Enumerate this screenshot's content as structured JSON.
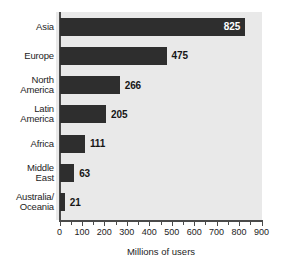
{
  "chart_data": {
    "type": "bar",
    "orientation": "horizontal",
    "title": "",
    "xlabel": "Millions of users",
    "ylabel": "",
    "categories": [
      "Asia",
      "Europe",
      "North America",
      "Latin America",
      "Africa",
      "Middle East",
      "Australia/ Oceania"
    ],
    "values": [
      825,
      475,
      266,
      205,
      111,
      63,
      21
    ],
    "value_labels": [
      "825",
      "475",
      "266",
      "205",
      "111",
      "63",
      "21"
    ],
    "xlim": [
      0,
      900
    ],
    "xticks": [
      0,
      100,
      200,
      300,
      400,
      500,
      600,
      700,
      800,
      900
    ],
    "xtick_labels": [
      "0",
      "100",
      "200",
      "300",
      "400",
      "500",
      "600",
      "700",
      "800",
      "900"
    ],
    "minor_tick_step": 50,
    "grid": false,
    "legend": false,
    "bar_color": "#2e2e2e",
    "plot_background": "#e9e9e9",
    "label_inside_first_bar": true
  },
  "rows": [
    {
      "line1": "Asia",
      "line2": "",
      "value": "825",
      "inside": true
    },
    {
      "line1": "Europe",
      "line2": "",
      "value": "475",
      "inside": false
    },
    {
      "line1": "North",
      "line2": "America",
      "value": "266",
      "inside": false
    },
    {
      "line1": "Latin",
      "line2": "America",
      "value": "205",
      "inside": false
    },
    {
      "line1": "Africa",
      "line2": "",
      "value": "111",
      "inside": false
    },
    {
      "line1": "Middle",
      "line2": "East",
      "value": "63",
      "inside": false
    },
    {
      "line1": "Australia/",
      "line2": "Oceania",
      "value": "21",
      "inside": false
    }
  ],
  "axis": {
    "title": "Millions of users",
    "ticks": [
      "0",
      "100",
      "200",
      "300",
      "400",
      "500",
      "600",
      "700",
      "800",
      "900"
    ]
  }
}
